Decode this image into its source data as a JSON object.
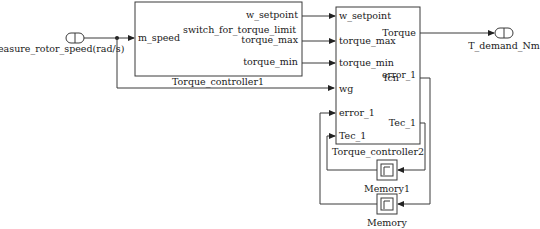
{
  "diagram": {
    "inport": {
      "label": "easure_rotor_speed(rad/s)"
    },
    "outport": {
      "label": "T_demand_Nm"
    },
    "block1": {
      "name": "Torque_controller1",
      "function_label": "switch_for_torque_limit",
      "inputs": [
        "m_speed"
      ],
      "outputs": [
        "w_setpoint",
        "torque_max",
        "torque_min"
      ]
    },
    "block2": {
      "name": "Torque_controller2",
      "function_label": "fcn",
      "inputs": [
        "w_setpoint",
        "torque_max",
        "torque_min",
        "wg",
        "error_1",
        "Tec_1"
      ],
      "outputs": [
        "Torque",
        "error_1",
        "Tec_1"
      ]
    },
    "memory1": {
      "name": "Memory1"
    },
    "memory": {
      "name": "Memory"
    }
  },
  "colors": {
    "line": "#3a3a3a",
    "background": "#ffffff"
  }
}
